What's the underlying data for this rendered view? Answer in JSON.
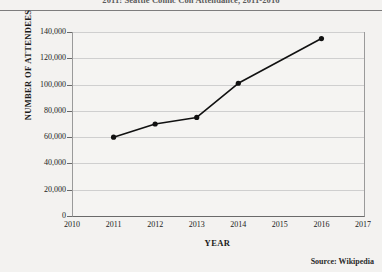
{
  "chart_title": "2011: Seattle Comic Con Attendance, 2011-2016",
  "source_note": "Source: Wikipedia",
  "axes": {
    "y_title": "NUMBER OF ATTENDEES",
    "x_title": "YEAR",
    "y_ticks": [
      "0",
      "20,000",
      "40,000",
      "60,000",
      "80,000",
      "100,000",
      "120,000",
      "140,000"
    ],
    "x_ticks": [
      "2010",
      "2011",
      "2012",
      "2013",
      "2014",
      "2015",
      "2016",
      "2017"
    ]
  },
  "colors": {
    "background": "#f3f2f0",
    "plot_background": "#f5f4f2",
    "gridline": "#cfcfcf",
    "axis": "#6a6a6a",
    "series": "#111111"
  },
  "chart_data": {
    "type": "line",
    "title": "2011: Seattle Comic Con Attendance, 2011-2016",
    "xlabel": "YEAR",
    "ylabel": "NUMBER OF ATTENDEES",
    "xlim": [
      2010,
      2017
    ],
    "ylim": [
      0,
      140000
    ],
    "ytick_step": 20000,
    "grid": true,
    "legend": false,
    "marker": "circle",
    "x": [
      2011,
      2012,
      2013,
      2014,
      2016
    ],
    "categories": [
      "2011",
      "2012",
      "2013",
      "2014",
      "2016"
    ],
    "values": [
      60000,
      70000,
      75000,
      101000,
      135000
    ],
    "series": [
      {
        "name": "Attendance",
        "points": [
          {
            "x": 2011,
            "y": 60000
          },
          {
            "x": 2012,
            "y": 70000
          },
          {
            "x": 2013,
            "y": 75000
          },
          {
            "x": 2014,
            "y": 101000
          },
          {
            "x": 2016,
            "y": 135000
          }
        ]
      }
    ]
  }
}
